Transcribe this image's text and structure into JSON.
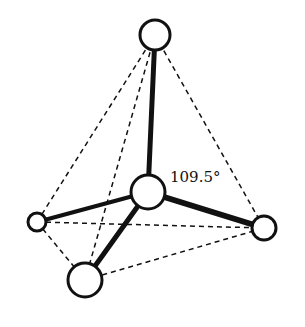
{
  "diagram": {
    "angle_label": "109.5°",
    "colors": {
      "stroke": "#111111",
      "background": "#ffffff",
      "atom_fill": "#ffffff"
    },
    "atoms": [
      {
        "id": "top",
        "role": "outer",
        "x": 155,
        "y": 35,
        "r": 15
      },
      {
        "id": "center",
        "role": "central",
        "x": 148,
        "y": 192,
        "r": 17
      },
      {
        "id": "left",
        "role": "outer",
        "x": 37,
        "y": 222,
        "r": 9
      },
      {
        "id": "right",
        "role": "outer",
        "x": 264,
        "y": 228,
        "r": 12
      },
      {
        "id": "bottom",
        "role": "outer",
        "x": 85,
        "y": 280,
        "r": 17
      }
    ],
    "bonds": [
      {
        "from": "center",
        "to": "top",
        "width": 5
      },
      {
        "from": "center",
        "to": "left",
        "width": 4
      },
      {
        "from": "center",
        "to": "right",
        "width": 6
      },
      {
        "from": "center",
        "to": "bottom",
        "width": 5
      }
    ],
    "edges_dashed": [
      {
        "from": "top",
        "to": "left"
      },
      {
        "from": "top",
        "to": "right"
      },
      {
        "from": "top",
        "to": "bottom"
      },
      {
        "from": "left",
        "to": "right"
      },
      {
        "from": "left",
        "to": "bottom"
      },
      {
        "from": "bottom",
        "to": "right"
      }
    ]
  }
}
